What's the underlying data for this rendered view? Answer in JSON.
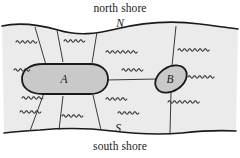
{
  "figure": {
    "name": "river-bridges-diagram",
    "labels": {
      "north_shore": "north shore",
      "south_shore": "south shore",
      "north_point": "N",
      "south_point": "S",
      "island_a": "A",
      "island_b": "B"
    },
    "colors": {
      "page_background": "#ffffff",
      "water_fill": "#ebebeb",
      "island_fill": "#c9c9c9",
      "outline": "#1a1a1a",
      "bridge_line": "#3a3a3a",
      "wave_stroke": "#2b2b2b",
      "text": "#1a1a1a"
    },
    "elements": {
      "water_region": "river-water-region",
      "island_a_shape": "island-a",
      "island_b_shape": "island-b",
      "north_bank_edge": "north-bank-edge",
      "south_bank_edge": "south-bank-edge"
    },
    "bridges": [
      {
        "name": "bridge-a-to-north-west",
        "from": "A",
        "to": "north shore"
      },
      {
        "name": "bridge-a-to-north-mid",
        "from": "A",
        "to": "north shore"
      },
      {
        "name": "bridge-a-to-north-east",
        "from": "A",
        "to": "north shore"
      },
      {
        "name": "bridge-a-to-south-west",
        "from": "A",
        "to": "south shore"
      },
      {
        "name": "bridge-a-to-south-mid",
        "from": "A",
        "to": "south shore"
      },
      {
        "name": "bridge-a-to-south-east",
        "from": "A",
        "to": "south shore"
      },
      {
        "name": "bridge-a-to-b",
        "from": "A",
        "to": "B"
      },
      {
        "name": "bridge-b-to-north",
        "from": "B",
        "to": "north shore"
      },
      {
        "name": "bridge-b-to-south",
        "from": "B",
        "to": "south shore"
      }
    ],
    "waves": [
      {
        "x": 16,
        "y": 42,
        "cycles": 4,
        "w": 5.2,
        "a": 2.4
      },
      {
        "x": 14,
        "y": 70,
        "cycles": 3,
        "w": 5.2,
        "a": 2.4
      },
      {
        "x": 22,
        "y": 98,
        "cycles": 4,
        "w": 5.2,
        "a": 2.4
      },
      {
        "x": 20,
        "y": 112,
        "cycles": 4,
        "w": 5.2,
        "a": 2.4
      },
      {
        "x": 64,
        "y": 41,
        "cycles": 4,
        "w": 5.2,
        "a": 2.4
      },
      {
        "x": 62,
        "y": 116,
        "cycles": 4,
        "w": 5.2,
        "a": 2.4
      },
      {
        "x": 106,
        "y": 52,
        "cycles": 6,
        "w": 5.2,
        "a": 2.4
      },
      {
        "x": 122,
        "y": 70,
        "cycles": 4,
        "w": 5.2,
        "a": 2.4
      },
      {
        "x": 106,
        "y": 99,
        "cycles": 4,
        "w": 5.2,
        "a": 2.4
      },
      {
        "x": 118,
        "y": 113,
        "cycles": 4,
        "w": 5.2,
        "a": 2.4
      },
      {
        "x": 178,
        "y": 50,
        "cycles": 6,
        "w": 5.2,
        "a": 2.4
      },
      {
        "x": 188,
        "y": 77,
        "cycles": 5,
        "w": 5.2,
        "a": 2.4
      },
      {
        "x": 168,
        "y": 102,
        "cycles": 6,
        "w": 5.2,
        "a": 2.4
      }
    ]
  }
}
